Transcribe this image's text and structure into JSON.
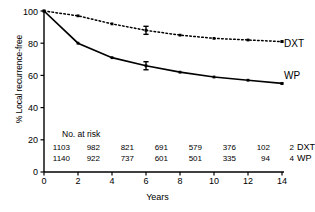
{
  "chart_data": {
    "type": "line",
    "title": "",
    "xlabel": "Years",
    "ylabel": "% Local recurrence-free",
    "xlim": [
      0,
      14
    ],
    "ylim": [
      0,
      100
    ],
    "xticks": [
      0,
      2,
      4,
      6,
      8,
      10,
      12,
      14
    ],
    "yticks": [
      0,
      20,
      40,
      60,
      80,
      100
    ],
    "grid": false,
    "legend_position": "right-inline-end-of-line",
    "x": [
      0,
      2,
      4,
      6,
      8,
      10,
      12,
      14
    ],
    "series": [
      {
        "name": "DXT",
        "style": "dotted",
        "values": [
          100,
          97,
          92,
          88,
          85,
          83,
          82,
          81
        ],
        "errorbar": {
          "x": 6,
          "y": 88,
          "low": 85.5,
          "high": 90.5
        }
      },
      {
        "name": "WP",
        "style": "solid",
        "values": [
          100,
          80,
          71,
          66,
          62,
          59,
          57,
          55
        ],
        "errorbar": {
          "x": 6,
          "y": 66,
          "low": 63.5,
          "high": 68.5
        }
      }
    ],
    "annotations": {
      "risk_table_title": "No. at risk",
      "risk_table": {
        "rows": [
          {
            "label": "DXT",
            "values": [
              "1103",
              "982",
              "821",
              "691",
              "579",
              "376",
              "102",
              "2"
            ]
          },
          {
            "label": "WP",
            "values": [
              "1140",
              "922",
              "737",
              "601",
              "501",
              "335",
              "94",
              "4"
            ]
          }
        ]
      }
    }
  },
  "axis": {
    "ytick_labels": [
      "0",
      "20",
      "40",
      "60",
      "80",
      "100"
    ],
    "xtick_labels": [
      "0",
      "2",
      "4",
      "6",
      "8",
      "10",
      "12",
      "14"
    ],
    "ylabel": "% Local recurrence-free",
    "xlabel": "Years"
  },
  "legend": {
    "dxt_label": "DXT",
    "wp_label": "WP"
  },
  "risk": {
    "title": "No. at risk",
    "dxt_tag": "DXT",
    "wp_tag": "WP"
  },
  "colors": {
    "line": "#000000",
    "background": "#ffffff",
    "text": "#000000"
  }
}
